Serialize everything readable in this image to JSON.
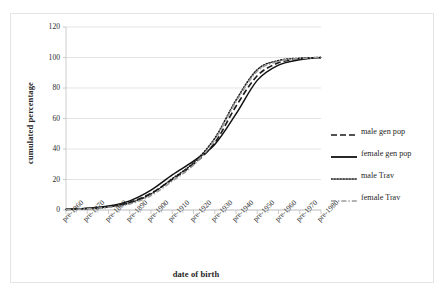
{
  "chart_data": {
    "type": "line",
    "title": "",
    "xlabel": "date of birth",
    "ylabel": "cumulated percentage",
    "ylim": [
      0,
      120
    ],
    "yticks": [
      0,
      20,
      40,
      60,
      80,
      100,
      120
    ],
    "grid": true,
    "legend_position": "right",
    "categories": [
      "pre-1860",
      "pre-1870",
      "pre-1880",
      "pre-1890",
      "pre-1900",
      "pre-1910",
      "pre-1920",
      "pre-1930",
      "pre-1940",
      "pre-1950",
      "pre-1960",
      "pre-1970",
      "pre-1980"
    ],
    "series": [
      {
        "name": "male gen pop",
        "style": "dashed",
        "color": "#1a1a1a",
        "values": [
          0.4,
          1.0,
          2.2,
          5.0,
          11.0,
          20.0,
          30.0,
          44.0,
          68.0,
          88.0,
          96.5,
          99.0,
          100.0
        ]
      },
      {
        "name": "female gen pop",
        "style": "solid",
        "color": "#111111",
        "values": [
          0.5,
          1.2,
          2.6,
          6.0,
          13.0,
          23.0,
          32.0,
          43.0,
          63.0,
          85.0,
          95.0,
          98.5,
          100.0
        ]
      },
      {
        "name": "male Trav",
        "style": "dotted",
        "color": "#1a1a1a",
        "values": [
          0.4,
          0.9,
          2.0,
          4.6,
          10.5,
          20.5,
          31.0,
          47.0,
          72.0,
          92.0,
          98.0,
          99.5,
          100.0
        ]
      },
      {
        "name": "female Trav",
        "style": "dashdot",
        "color": "#9a9a9a",
        "values": [
          0.3,
          0.8,
          1.8,
          4.0,
          9.5,
          19.0,
          29.5,
          46.0,
          71.0,
          91.0,
          97.5,
          99.3,
          100.0
        ]
      }
    ]
  },
  "axes": {
    "y_title": "cumulated percentage",
    "x_title": "date of birth",
    "y_tick_labels": [
      "0",
      "20",
      "40",
      "60",
      "80",
      "100",
      "120"
    ],
    "x_tick_labels": [
      "pre-1860",
      "pre-1870",
      "pre-1880",
      "pre-1890",
      "pre-1900",
      "pre-1910",
      "pre-1920",
      "pre-1930",
      "pre-1940",
      "pre-1950",
      "pre-1960",
      "pre-1970",
      "pre-1980"
    ]
  },
  "legend": {
    "items": [
      {
        "label": "male gen pop",
        "style": "dashed",
        "color": "#1a1a1a"
      },
      {
        "label": "female gen pop",
        "style": "solid",
        "color": "#111111"
      },
      {
        "label": "male Trav",
        "style": "dotted",
        "color": "#1a1a1a"
      },
      {
        "label": "female Trav",
        "style": "dashdot",
        "color": "#9a9a9a"
      }
    ]
  },
  "colors": {
    "plot_background": "#ffffff",
    "frame_border": "#e4e4e4",
    "gridline": "#d9d9d9",
    "axis_line": "#bfbfbf",
    "text": "#1f1f1f"
  }
}
